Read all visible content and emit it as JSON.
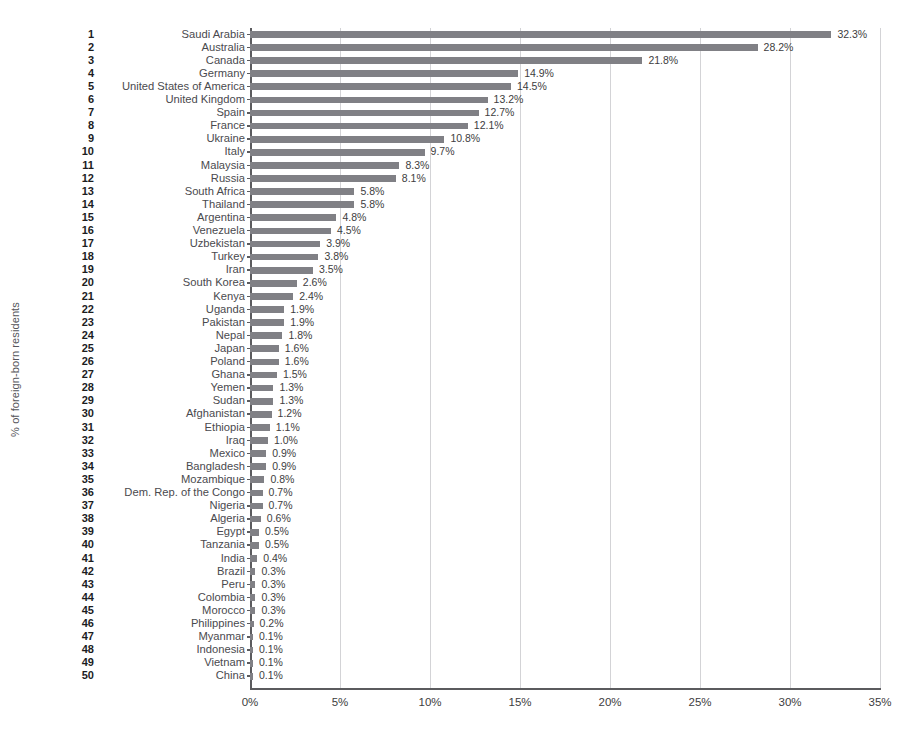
{
  "chart_data": {
    "type": "bar",
    "orientation": "horizontal",
    "title": "",
    "xlabel": "",
    "ylabel": "% of foreign-born residents",
    "xlim": [
      0,
      35
    ],
    "xticks": [
      "0%",
      "5%",
      "10%",
      "15%",
      "20%",
      "25%",
      "30%",
      "35%"
    ],
    "xtick_values": [
      0,
      5,
      10,
      15,
      20,
      25,
      30,
      35
    ],
    "grid": "vertical",
    "legend": "none",
    "bar_color": "#808085",
    "categories": [
      "Saudi Arabia",
      "Australia",
      "Canada",
      "Germany",
      "United States of America",
      "United Kingdom",
      "Spain",
      "France",
      "Ukraine",
      "Italy",
      "Malaysia",
      "Russia",
      "South Africa",
      "Thailand",
      "Argentina",
      "Venezuela",
      "Uzbekistan",
      "Turkey",
      "Iran",
      "South Korea",
      "Kenya",
      "Uganda",
      "Pakistan",
      "Nepal",
      "Japan",
      "Poland",
      "Ghana",
      "Yemen",
      "Sudan",
      "Afghanistan",
      "Ethiopia",
      "Iraq",
      "Mexico",
      "Bangladesh",
      "Mozambique",
      "Dem. Rep. of the Congo",
      "Nigeria",
      "Algeria",
      "Egypt",
      "Tanzania",
      "India",
      "Brazil",
      "Peru",
      "Colombia",
      "Morocco",
      "Philippines",
      "Myanmar",
      "Indonesia",
      "Vietnam",
      "China"
    ],
    "ranks": [
      "1",
      "2",
      "3",
      "4",
      "5",
      "6",
      "7",
      "8",
      "9",
      "10",
      "11",
      "12",
      "13",
      "14",
      "15",
      "16",
      "17",
      "18",
      "19",
      "20",
      "21",
      "22",
      "23",
      "24",
      "25",
      "26",
      "27",
      "28",
      "29",
      "30",
      "31",
      "32",
      "33",
      "34",
      "35",
      "36",
      "37",
      "38",
      "39",
      "40",
      "41",
      "42",
      "43",
      "44",
      "45",
      "46",
      "47",
      "48",
      "49",
      "50"
    ],
    "values": [
      32.3,
      28.2,
      21.8,
      14.9,
      14.5,
      13.2,
      12.7,
      12.1,
      10.8,
      9.7,
      8.3,
      8.1,
      5.8,
      5.8,
      4.8,
      4.5,
      3.9,
      3.8,
      3.5,
      2.6,
      2.4,
      1.9,
      1.9,
      1.8,
      1.6,
      1.6,
      1.5,
      1.3,
      1.3,
      1.2,
      1.1,
      1.0,
      0.9,
      0.9,
      0.8,
      0.7,
      0.7,
      0.6,
      0.5,
      0.5,
      0.4,
      0.3,
      0.3,
      0.3,
      0.3,
      0.2,
      0.1,
      0.1,
      0.1,
      0.1
    ],
    "value_labels": [
      "32.3%",
      "28.2%",
      "21.8%",
      "14.9%",
      "14.5%",
      "13.2%",
      "12.7%",
      "12.1%",
      "10.8%",
      "9.7%",
      "8.3%",
      "8.1%",
      "5.8%",
      "5.8%",
      "4.8%",
      "4.5%",
      "3.9%",
      "3.8%",
      "3.5%",
      "2.6%",
      "2.4%",
      "1.9%",
      "1.9%",
      "1.8%",
      "1.6%",
      "1.6%",
      "1.5%",
      "1.3%",
      "1.3%",
      "1.2%",
      "1.1%",
      "1.0%",
      "0.9%",
      "0.9%",
      "0.8%",
      "0.7%",
      "0.7%",
      "0.6%",
      "0.5%",
      "0.5%",
      "0.4%",
      "0.3%",
      "0.3%",
      "0.3%",
      "0.3%",
      "0.2%",
      "0.1%",
      "0.1%",
      "0.1%",
      "0.1%"
    ]
  }
}
